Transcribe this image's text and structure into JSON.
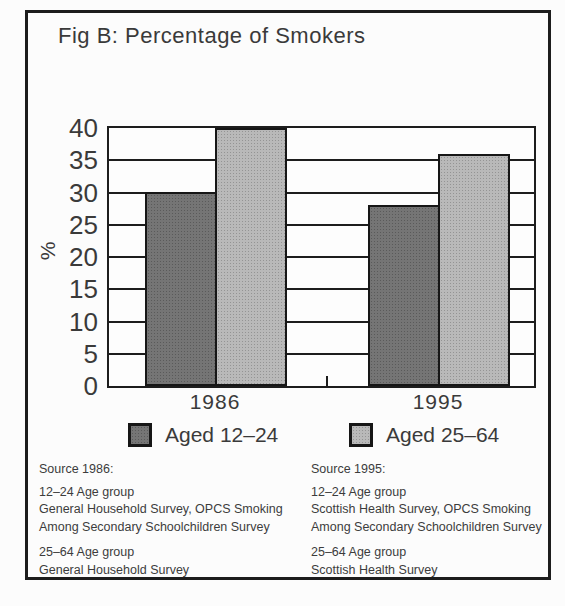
{
  "title": "Fig B: Percentage of Smokers",
  "chart_data": {
    "type": "bar",
    "categories": [
      "1986",
      "1995"
    ],
    "series": [
      {
        "name": "Aged 12–24",
        "values": [
          30,
          28
        ],
        "color": "#6e6e6e"
      },
      {
        "name": "Aged 25–64",
        "values": [
          40,
          36
        ],
        "color": "#b5b5b5"
      }
    ],
    "title": "Fig B: Percentage of Smokers",
    "xlabel": "",
    "ylabel": "%",
    "ylim": [
      0,
      40
    ],
    "ytick_step": 5,
    "grid": true,
    "legend_position": "bottom"
  },
  "legend": {
    "items": [
      {
        "label": "Aged 12–24",
        "color": "#6e6e6e"
      },
      {
        "label": "Aged 25–64",
        "color": "#b5b5b5"
      }
    ]
  },
  "footnotes": {
    "left": {
      "heading": "Source 1986:",
      "group1": "12–24 Age group\nGeneral Household Survey, OPCS Smoking\nAmong Secondary Schoolchildren Survey",
      "group2": "25–64 Age group\nGeneral Household Survey"
    },
    "right": {
      "heading": "Source 1995:",
      "group1": "12–24 Age group\nScottish Health Survey, OPCS Smoking\nAmong Secondary Schoolchildren Survey",
      "group2": "25–64 Age group\nScottish Health Survey"
    }
  }
}
